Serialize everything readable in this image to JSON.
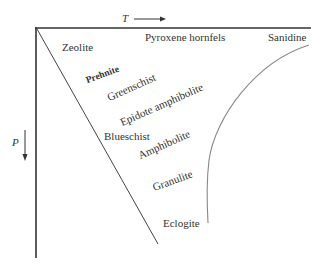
{
  "diagram": {
    "type": "metamorphic-facies-PT-diagram",
    "axes": {
      "temperature": {
        "label": "T",
        "direction": "increasing-right"
      },
      "pressure": {
        "label": "P",
        "direction": "increasing-down"
      }
    },
    "facies": [
      {
        "name": "Zeolite"
      },
      {
        "name": "Prehnite"
      },
      {
        "name": "Greenschist"
      },
      {
        "name": "Epidote amphibolite"
      },
      {
        "name": "Blueschist"
      },
      {
        "name": "Amphibolite"
      },
      {
        "name": "Granulite"
      },
      {
        "name": "Eclogite"
      },
      {
        "name": "Pyroxene hornfels"
      },
      {
        "name": "Sanidine"
      }
    ],
    "colors": {
      "lines": "#333333",
      "curve": "#777777",
      "text": "#333333"
    }
  }
}
